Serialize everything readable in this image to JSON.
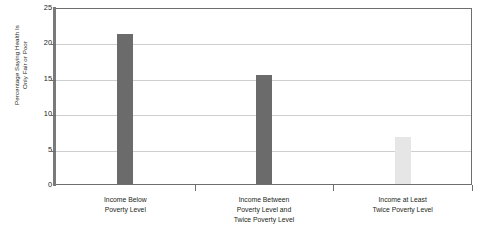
{
  "chart_data": {
    "type": "bar",
    "title": "",
    "xlabel": "",
    "ylabel": "Percentage Saying Health Is Only Fair or Poor",
    "ylabel_lines": [
      "Percentage Saying Health Is",
      "Only Fair or Poor"
    ],
    "categories": [
      "Income Below Poverty Level",
      "Income Between Poverty Level and Twice Poverty Level",
      "Income at Least Twice Poverty Level"
    ],
    "category_lines": [
      [
        "Income Below",
        "Poverty Level"
      ],
      [
        "Income Between",
        "Poverty Level and",
        "Twice Poverty Level"
      ],
      [
        "Income at Least",
        "Twice Poverty Level"
      ]
    ],
    "values": [
      21.2,
      15.4,
      6.6
    ],
    "ylim": [
      0,
      25
    ],
    "yticks": [
      0,
      5,
      10,
      15,
      20,
      25
    ],
    "ytick_labels": [
      "0",
      "5",
      "10",
      "15",
      "20",
      "25"
    ],
    "grid": true,
    "legend": "none",
    "bar_colors": [
      "#6b6b6b",
      "#6b6b6b",
      "#e6e6e6"
    ]
  },
  "colors": {
    "bar_dark": "#6b6b6b",
    "bar_light": "#e6e6e6",
    "axis": "#6e6e6e",
    "gridline": "#cfcfcf",
    "text": "#231f20",
    "background": "#ffffff"
  }
}
